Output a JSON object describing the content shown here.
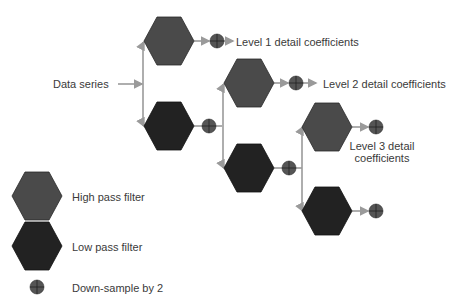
{
  "diagram": {
    "input_label": "Data series",
    "outputs": [
      {
        "label": "Level 1 detail coefficients"
      },
      {
        "label": "Level 2 detail coefficients"
      },
      {
        "label_line1": "Level 3 detail",
        "label_line2": "coefficients"
      }
    ]
  },
  "legend": {
    "items": [
      {
        "shape": "hexagon",
        "color": "#4a4a4a",
        "label": "High pass filter"
      },
      {
        "shape": "hexagon",
        "color": "#222222",
        "label": "Low pass filter"
      },
      {
        "shape": "circle-plus",
        "color": "#555555",
        "label": "Down-sample by 2"
      }
    ]
  },
  "colors": {
    "high_pass": "#4a4a4a",
    "low_pass": "#222222",
    "downsample": "#555555",
    "connector": "#9a9a9a",
    "text": "#3a3a3a"
  }
}
